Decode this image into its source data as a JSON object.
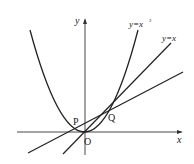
{
  "diagram": {
    "type": "function-graph",
    "axes": {
      "x_label": "x",
      "y_label": "y",
      "origin_label": "O"
    },
    "curves": [
      {
        "name": "parabola",
        "label": "y=x",
        "label_sup": "2",
        "equation": "y = x^2"
      },
      {
        "name": "line-y-equals-x",
        "label": "y=x",
        "equation": "y = x"
      },
      {
        "name": "tangent-line",
        "label": "",
        "equation": "line through P and Q"
      }
    ],
    "points": [
      {
        "name": "P",
        "label": "P"
      },
      {
        "name": "Q",
        "label": "Q"
      },
      {
        "name": "O",
        "label": "O"
      }
    ]
  }
}
